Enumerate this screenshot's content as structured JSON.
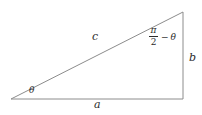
{
  "figure": {
    "type": "right-triangle-diagram",
    "background_color": "#ffffff",
    "stroke_color": "#8c8c8c",
    "text_color": "#2b2b2b"
  },
  "labels": {
    "hypotenuse": "c",
    "base": "a",
    "vertical": "b",
    "base_angle": "θ"
  },
  "apex_angle": {
    "numerator": "π",
    "denominator": "2",
    "operator": "−",
    "theta": "θ",
    "full_text": "π/2 − θ"
  },
  "geometry": {
    "left_vertex": [
      11,
      99
    ],
    "top_right_vertex": [
      183,
      12
    ],
    "bottom_right_vertex": [
      183,
      99
    ],
    "base_length_px": 172,
    "vertical_length_px": 87
  }
}
